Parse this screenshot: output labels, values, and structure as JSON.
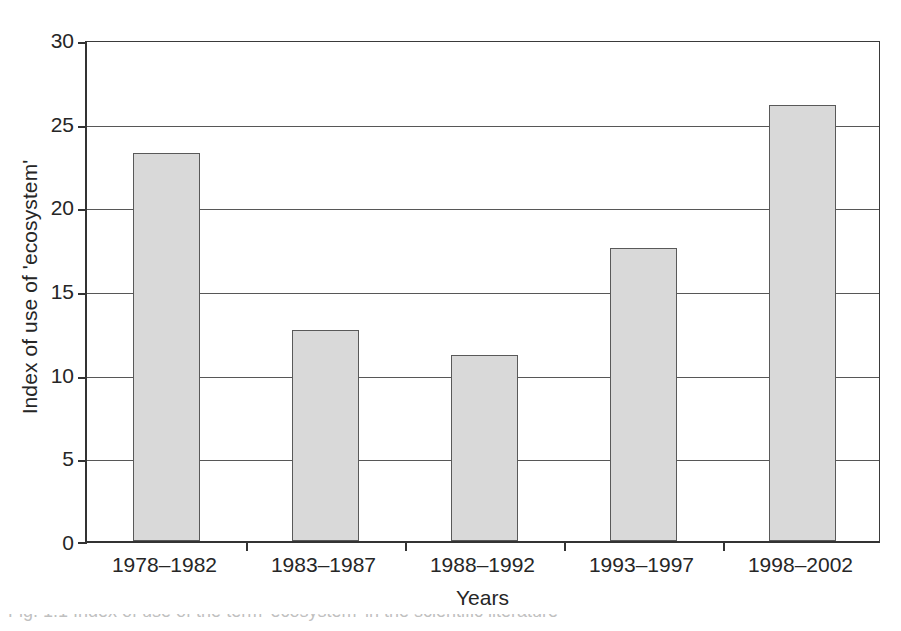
{
  "figure": {
    "background_color": "#ffffff",
    "caption_partial": "Fig. 1.1 Index of use of the term 'ecosystem' in the scientific literature"
  },
  "chart_data": {
    "type": "bar",
    "title": "",
    "xlabel": "Years",
    "ylabel": "Index of use of 'ecosystem'",
    "categories": [
      "1978–1982",
      "1983–1987",
      "1988–1992",
      "1993–1997",
      "1998–2002"
    ],
    "values": [
      23.3,
      12.7,
      11.2,
      17.6,
      26.2
    ],
    "ylim": [
      0,
      30
    ],
    "yticks": [
      0,
      5,
      10,
      15,
      20,
      25,
      30
    ],
    "ytick_labels": [
      "0",
      "5",
      "10",
      "15",
      "20",
      "25",
      "30"
    ],
    "grid": "horizontal",
    "legend": "none",
    "bar_fill_color": "#d9d9d9",
    "bar_edge_color": "#595959",
    "axis_color": "#333333",
    "gridline_color": "#575757"
  }
}
